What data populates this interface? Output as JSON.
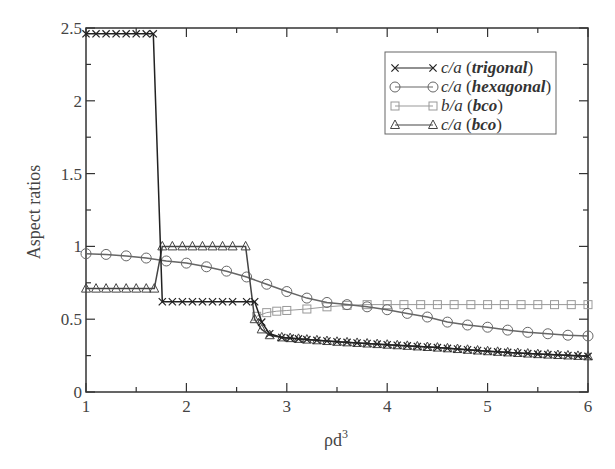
{
  "chart_data": {
    "type": "line",
    "title": "",
    "xlabel": "ρd³",
    "xlabel_base": "ρd",
    "xlabel_sup": "3",
    "ylabel": "Aspect ratios",
    "xlim": [
      1,
      6
    ],
    "ylim": [
      0,
      2.5
    ],
    "xticks": [
      1,
      2,
      3,
      4,
      5,
      6
    ],
    "xtick_labels": [
      "1",
      "2",
      "3",
      "4",
      "5",
      "6"
    ],
    "yticks": [
      0,
      0.5,
      1,
      1.5,
      2,
      2.5
    ],
    "ytick_labels": [
      "0",
      "0.5",
      "1",
      "1.5",
      "2",
      "2.5"
    ],
    "grid": false,
    "legend_position": "upper right",
    "series": [
      {
        "name": "c/a (trigonal)",
        "legend_italic": "c/a",
        "legend_bold": "trigonal",
        "marker": "x",
        "color": "#222222",
        "points": [
          [
            1.0,
            2.46
          ],
          [
            1.1,
            2.46
          ],
          [
            1.2,
            2.46
          ],
          [
            1.3,
            2.46
          ],
          [
            1.4,
            2.46
          ],
          [
            1.5,
            2.46
          ],
          [
            1.6,
            2.46
          ],
          [
            1.67,
            2.46
          ],
          [
            1.76,
            0.62
          ],
          [
            1.86,
            0.62
          ],
          [
            1.96,
            0.62
          ],
          [
            2.06,
            0.62
          ],
          [
            2.16,
            0.62
          ],
          [
            2.26,
            0.62
          ],
          [
            2.36,
            0.62
          ],
          [
            2.46,
            0.62
          ],
          [
            2.6,
            0.62
          ],
          [
            2.68,
            0.62
          ],
          [
            2.75,
            0.48
          ],
          [
            2.83,
            0.4
          ],
          [
            2.95,
            0.375
          ],
          [
            3.2,
            0.36
          ],
          [
            3.5,
            0.345
          ],
          [
            4.0,
            0.325
          ],
          [
            4.5,
            0.305
          ],
          [
            5.0,
            0.28
          ],
          [
            5.5,
            0.26
          ],
          [
            6.0,
            0.245
          ]
        ]
      },
      {
        "name": "c/a (hexagonal)",
        "legend_italic": "c/a",
        "legend_bold": "hexagonal",
        "marker": "circle",
        "color": "#666666",
        "points": [
          [
            1.0,
            0.95
          ],
          [
            1.2,
            0.945
          ],
          [
            1.4,
            0.935
          ],
          [
            1.6,
            0.92
          ],
          [
            1.8,
            0.9
          ],
          [
            2.0,
            0.885
          ],
          [
            2.2,
            0.86
          ],
          [
            2.4,
            0.83
          ],
          [
            2.6,
            0.79
          ],
          [
            2.8,
            0.74
          ],
          [
            3.0,
            0.69
          ],
          [
            3.2,
            0.645
          ],
          [
            3.4,
            0.615
          ],
          [
            3.6,
            0.6
          ],
          [
            3.8,
            0.585
          ],
          [
            4.0,
            0.565
          ],
          [
            4.2,
            0.54
          ],
          [
            4.4,
            0.515
          ],
          [
            4.6,
            0.48
          ],
          [
            4.8,
            0.46
          ],
          [
            5.0,
            0.445
          ],
          [
            5.2,
            0.425
          ],
          [
            5.4,
            0.41
          ],
          [
            5.6,
            0.4
          ],
          [
            5.8,
            0.39
          ],
          [
            6.0,
            0.385
          ]
        ]
      },
      {
        "name": "b/a (bco)",
        "legend_italic": "b/a",
        "legend_bold": "bco",
        "marker": "square",
        "color": "#999999",
        "points": [
          [
            2.7,
            0.52
          ],
          [
            2.8,
            0.545
          ],
          [
            2.9,
            0.555
          ],
          [
            3.0,
            0.56
          ],
          [
            3.2,
            0.57
          ],
          [
            3.4,
            0.585
          ],
          [
            3.6,
            0.595
          ],
          [
            3.8,
            0.6
          ],
          [
            4.0,
            0.6
          ],
          [
            4.5,
            0.6
          ],
          [
            5.0,
            0.6
          ],
          [
            5.5,
            0.6
          ],
          [
            6.0,
            0.6
          ]
        ]
      },
      {
        "name": "c/a (bco)",
        "legend_italic": "c/a",
        "legend_bold": "bco",
        "marker": "triangle",
        "color": "#444444",
        "points": [
          [
            1.0,
            0.71
          ],
          [
            1.1,
            0.71
          ],
          [
            1.2,
            0.71
          ],
          [
            1.3,
            0.71
          ],
          [
            1.4,
            0.71
          ],
          [
            1.5,
            0.71
          ],
          [
            1.6,
            0.71
          ],
          [
            1.68,
            0.71
          ],
          [
            1.76,
            1.0
          ],
          [
            1.86,
            1.0
          ],
          [
            1.96,
            1.0
          ],
          [
            2.06,
            1.0
          ],
          [
            2.16,
            1.0
          ],
          [
            2.26,
            1.0
          ],
          [
            2.36,
            1.0
          ],
          [
            2.46,
            1.0
          ],
          [
            2.59,
            1.0
          ],
          [
            2.68,
            0.5
          ],
          [
            2.75,
            0.43
          ],
          [
            2.83,
            0.39
          ],
          [
            2.95,
            0.375
          ],
          [
            3.2,
            0.36
          ],
          [
            3.5,
            0.345
          ],
          [
            4.0,
            0.325
          ],
          [
            4.5,
            0.305
          ],
          [
            5.0,
            0.28
          ],
          [
            5.5,
            0.26
          ],
          [
            6.0,
            0.245
          ]
        ]
      }
    ]
  }
}
